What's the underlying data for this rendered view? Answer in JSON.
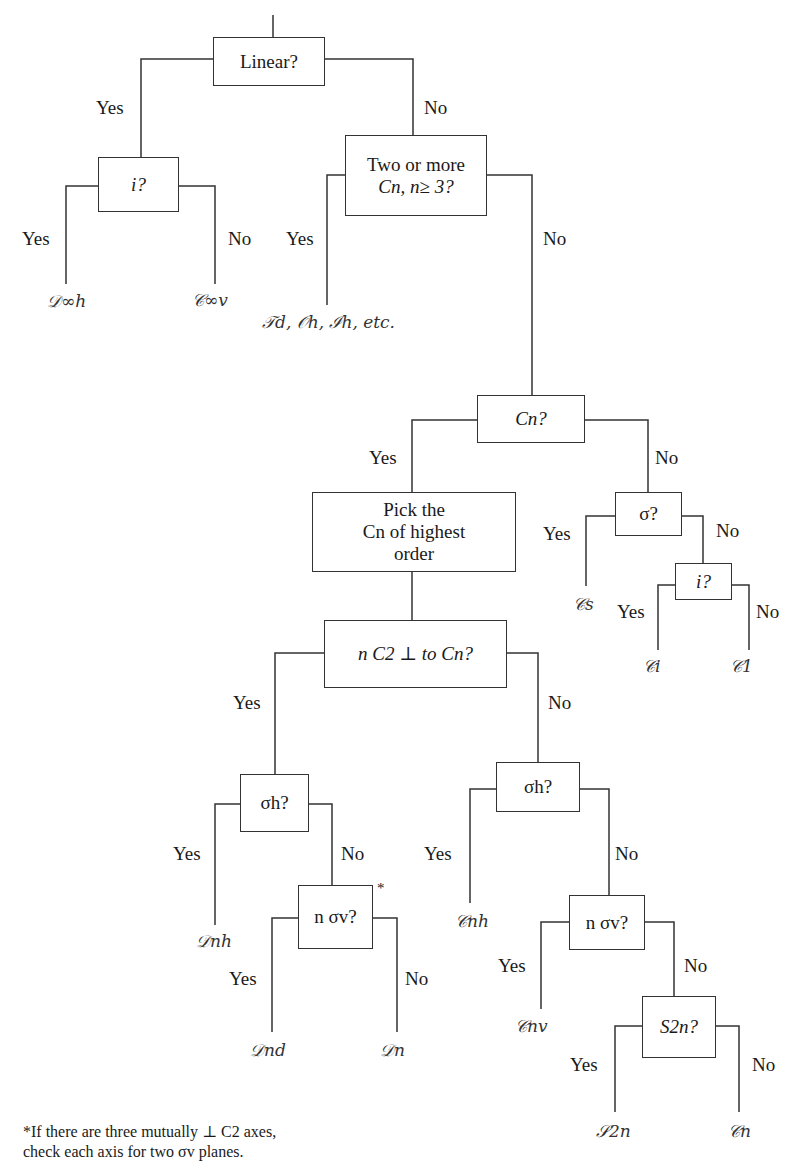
{
  "diagram": {
    "type": "decision-tree",
    "answer_yes": "Yes",
    "answer_no": "No",
    "nodes": {
      "linear": "Linear?",
      "inversion_linear": "i?",
      "multiple_cn_line1": "Two or more",
      "multiple_cn_line2": "Cn, n≥ 3?",
      "cn": "Cn?",
      "pick_line1": "Pick the",
      "pick_line2": "Cn of highest",
      "pick_line3": "order",
      "sigma": "σ?",
      "inversion_low": "i?",
      "nc2_perp": "n C2 ⊥ to Cn?",
      "sigma_h_d": "σh?",
      "n_sigma_v_d": "n σv?",
      "sigma_h_c": "σh?",
      "n_sigma_v_c": "n σv?",
      "s2n": "S2n?"
    },
    "leaves": {
      "d_inf_h": "𝒟∞h",
      "c_inf_v": "𝒞∞v",
      "high_symmetry": "𝒯d, 𝒪h, ℐh, etc.",
      "cs": "𝒞s",
      "ci": "𝒞i",
      "c1": "𝒞1",
      "dnh": "𝒟nh",
      "dnd": "𝒟nd",
      "dn": "𝒟n",
      "cnh": "𝒞nh",
      "cnv": "𝒞nv",
      "s2n": "𝒮2n",
      "cn": "𝒞n"
    },
    "asterisk": "*",
    "footnote_line1": "*If there are three mutually ⊥ C2 axes,",
    "footnote_line2": "check each axis for two σv planes."
  }
}
